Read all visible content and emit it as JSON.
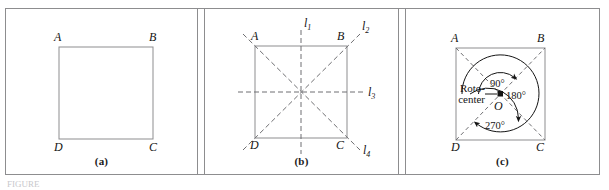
{
  "figure": {
    "line_color": "#8d8d8f",
    "dash_color": "#6f6f72",
    "ink_color": "#141414",
    "frame_color": "#8d8d8f",
    "background": "#ffffff",
    "bottom_strip_text": "FIGURE"
  },
  "panels": [
    {
      "id": "a",
      "caption": "(a)",
      "vertices": [
        {
          "name": "A",
          "label": "A"
        },
        {
          "name": "B",
          "label": "B"
        },
        {
          "name": "C",
          "label": "C"
        },
        {
          "name": "D",
          "label": "D"
        }
      ]
    },
    {
      "id": "b",
      "caption": "(b)",
      "vertices": [
        {
          "name": "A",
          "label": "A"
        },
        {
          "name": "B",
          "label": "B"
        },
        {
          "name": "C",
          "label": "C"
        },
        {
          "name": "D",
          "label": "D"
        }
      ],
      "symmetry_lines": [
        {
          "name": "l1",
          "label": "l",
          "subscript": "1",
          "orientation": "vertical"
        },
        {
          "name": "l2",
          "label": "l",
          "subscript": "2",
          "orientation": "diagonal-up-right"
        },
        {
          "name": "l3",
          "label": "l",
          "subscript": "3",
          "orientation": "horizontal"
        },
        {
          "name": "l4",
          "label": "l",
          "subscript": "4",
          "orientation": "diagonal-down-right"
        }
      ]
    },
    {
      "id": "c",
      "caption": "(c)",
      "vertices": [
        {
          "name": "A",
          "label": "A"
        },
        {
          "name": "B",
          "label": "B"
        },
        {
          "name": "C",
          "label": "C"
        },
        {
          "name": "D",
          "label": "D"
        }
      ],
      "center": {
        "name": "O",
        "label": "O"
      },
      "rotocenter_label_line1": "Roto-",
      "rotocenter_label_line2": "center",
      "rotations": [
        {
          "name": "rotation-90",
          "label": "90°"
        },
        {
          "name": "rotation-180",
          "label": "180°"
        },
        {
          "name": "rotation-270",
          "label": "270°"
        }
      ]
    }
  ]
}
